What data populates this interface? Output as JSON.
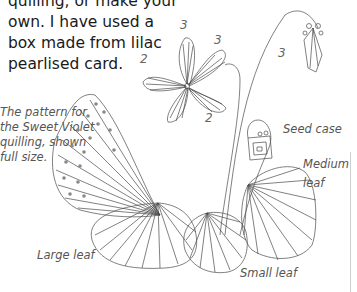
{
  "intro_text": {
    "lines": [
      "quilling, or make your",
      "own. I have used a",
      "box made from lilac",
      "pearlised card."
    ]
  },
  "caption": {
    "lines": [
      "The pattern for",
      "the Sweet Violet",
      "quilling, shown",
      "full size."
    ]
  },
  "labels": {
    "seed_case": "Seed case",
    "medium_leaf_line1": "Medium",
    "medium_leaf_line2": "leaf",
    "large_leaf": "Large leaf",
    "small_leaf": "Small leaf"
  },
  "petal_numbers": {
    "flower_top": "3",
    "flower_right": "3",
    "flower_left": "2",
    "flower_bottom": "2",
    "bud": "3"
  },
  "colors": {
    "line_art": "#4a4a4a",
    "body_text": "#1a1a1a",
    "caption_text": "#555555"
  }
}
